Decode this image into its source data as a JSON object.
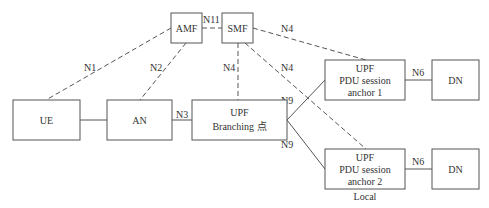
{
  "diagram": {
    "nodes": {
      "amf": {
        "label": "AMF"
      },
      "smf": {
        "label": "SMF"
      },
      "ue": {
        "label": "UE"
      },
      "an": {
        "label": "AN"
      },
      "upf_branch": {
        "line1": "UPF",
        "line2": "Branching 点"
      },
      "upf_anchor1": {
        "line1": "UPF",
        "line2": "PDU session",
        "line3": "anchor 1"
      },
      "dn1": {
        "label": "DN"
      },
      "upf_anchor2": {
        "line1": "UPF",
        "line2": "PDU session",
        "line3": "anchor 2",
        "caption": "Local"
      },
      "dn2": {
        "label": "DN"
      }
    },
    "edges": {
      "n1": "N1",
      "n2": "N2",
      "n3": "N3",
      "n11": "N11",
      "n4_branch": "N4",
      "n4_anchor1": "N4",
      "n4_anchor2": "N4",
      "n9_top": "N9",
      "n9_bottom": "N9",
      "n6_top": "N6",
      "n6_bottom": "N6"
    }
  }
}
